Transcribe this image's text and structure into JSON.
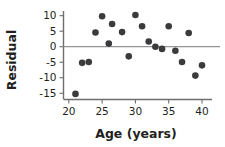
{
  "chart_data": {
    "type": "scatter",
    "title": "",
    "xlabel": "Age (years)",
    "ylabel": "Residual",
    "xlim": [
      19.2,
      41.5
    ],
    "ylim": [
      -17.0,
      11.5
    ],
    "xticks": [
      20,
      25,
      30,
      35,
      40
    ],
    "yticks": [
      10,
      5,
      0,
      -5,
      -10,
      -15
    ],
    "xticklabels": [
      "20",
      "25",
      "30",
      "35",
      "40"
    ],
    "yticklabels": [
      "10",
      "5",
      "0",
      "-5",
      "-10",
      "-15"
    ],
    "grid": false,
    "legend": null,
    "reference_line": {
      "name": "zero-residual-line",
      "orientation": "horizontal",
      "y": 0,
      "color": "#939598"
    },
    "marker": {
      "shape": "circle",
      "color": "#3b3b3d",
      "size": 3.3
    },
    "x": [
      21,
      22,
      23,
      24,
      25,
      26,
      26.5,
      28,
      29,
      30,
      31,
      32,
      33,
      34,
      35,
      36,
      37,
      38,
      39,
      40
    ],
    "y": [
      -15.2,
      -5.2,
      -4.9,
      4.6,
      9.8,
      1.0,
      7.3,
      4.7,
      -3.1,
      10.2,
      6.6,
      1.7,
      0.0,
      -0.7,
      6.6,
      -1.3,
      -4.9,
      4.4,
      -9.3,
      -6.0
    ],
    "points": [
      {
        "x": 21,
        "y": -15.2
      },
      {
        "x": 22,
        "y": -5.2
      },
      {
        "x": 23,
        "y": -4.9
      },
      {
        "x": 24,
        "y": 4.6
      },
      {
        "x": 25,
        "y": 9.8
      },
      {
        "x": 26,
        "y": 1.0
      },
      {
        "x": 26.5,
        "y": 7.3
      },
      {
        "x": 28,
        "y": 4.7
      },
      {
        "x": 29,
        "y": -3.1
      },
      {
        "x": 30,
        "y": 10.2
      },
      {
        "x": 31,
        "y": 6.6
      },
      {
        "x": 32,
        "y": 1.7
      },
      {
        "x": 33,
        "y": 0.0
      },
      {
        "x": 34,
        "y": -0.7
      },
      {
        "x": 35,
        "y": 6.6
      },
      {
        "x": 36,
        "y": -1.3
      },
      {
        "x": 37,
        "y": -4.9
      },
      {
        "x": 38,
        "y": 4.4
      },
      {
        "x": 39,
        "y": -9.3
      },
      {
        "x": 40,
        "y": -6.0
      }
    ]
  },
  "colors": {
    "axis": "#6d6e71",
    "zero_line": "#939598",
    "point": "#3b3b3d",
    "text": "#231f20",
    "background": "#ffffff"
  }
}
